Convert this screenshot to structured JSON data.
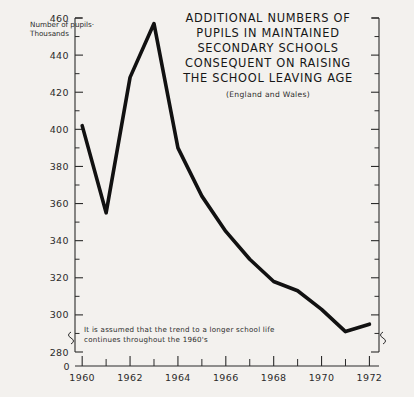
{
  "chart_data": {
    "type": "line",
    "title": "ADDITIONAL NUMBERS OF PUPILS IN MAINTAINED SECONDARY SCHOOLS CONSEQUENT ON RAISING THE SCHOOL LEAVING AGE",
    "title_lines": [
      "ADDITIONAL NUMBERS OF",
      "PUPILS IN MAINTAINED",
      "SECONDARY SCHOOLS",
      "CONSEQUENT ON RAISING",
      "THE SCHOOL LEAVING AGE"
    ],
    "subtitle": "(England and Wales)",
    "xlabel": "",
    "ylabel": "Number of pupils- Thousands",
    "ylabel_lines": [
      "Number of pupils·",
      "Thousands"
    ],
    "annotation_lines": [
      "It is assumed that the trend to a longer school life",
      "continues throughout the 1960's"
    ],
    "x": [
      1960,
      1961,
      1962,
      1963,
      1964,
      1965,
      1966,
      1967,
      1968,
      1969,
      1970,
      1971,
      1972
    ],
    "values": [
      402,
      355,
      428,
      457,
      390,
      364,
      345,
      330,
      318,
      313,
      303,
      291,
      295
    ],
    "xlim": [
      1959.7,
      1972.4
    ],
    "ylim": [
      280,
      460
    ],
    "yticks": [
      280,
      300,
      320,
      340,
      360,
      380,
      400,
      420,
      440,
      460
    ],
    "ytick_labels": [
      "280",
      "300",
      "320",
      "340",
      "360",
      "380",
      "400",
      "420",
      "440",
      "460"
    ],
    "y_axis_break": true,
    "y_origin_label": "0",
    "xticks": [
      1960,
      1962,
      1964,
      1966,
      1968,
      1970,
      1972
    ],
    "xtick_labels": [
      "1960",
      "1962",
      "1964",
      "1966",
      "1968",
      "1970",
      "1972"
    ],
    "x_minor_ticks": [
      1961,
      1963,
      1965,
      1967,
      1969,
      1971
    ],
    "grid": false,
    "legend": false,
    "line_color": "#111111",
    "axis_color": "#2b2b2b",
    "background_color": "#f3f1ee"
  }
}
